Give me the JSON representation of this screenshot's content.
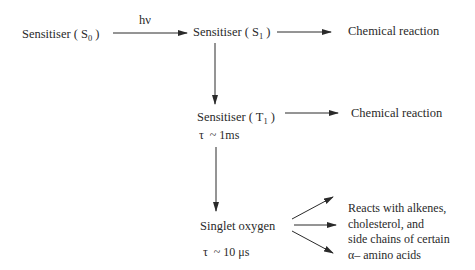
{
  "diagram": {
    "nodes": {
      "s0": {
        "label": "Sensitiser (",
        "sub": "0",
        "sub_prefix": "S",
        "suffix": " )"
      },
      "s1": {
        "label": "Sensitiser (",
        "sub": "1",
        "sub_prefix": "S",
        "suffix": " )"
      },
      "t1": {
        "label": "Sensitiser (",
        "sub": "1",
        "sub_prefix": "T",
        "suffix": " )"
      },
      "singlet": {
        "label": "Singlet oxygen"
      }
    },
    "edge_labels": {
      "excitation": "hν"
    },
    "lifetimes": {
      "t1": "τ  ~ 1ms",
      "singlet": "τ  ~ 10 μs"
    },
    "outcomes": {
      "s1_reaction": "Chemical reaction",
      "t1_reaction": "Chemical reaction",
      "singlet_reaction_lines": [
        "Reacts with alkenes,",
        "cholesterol, and",
        "side chains of certain",
        "α– amino acids"
      ]
    },
    "colors": {
      "ink": "#2a2a2a",
      "background": "#ffffff"
    }
  }
}
